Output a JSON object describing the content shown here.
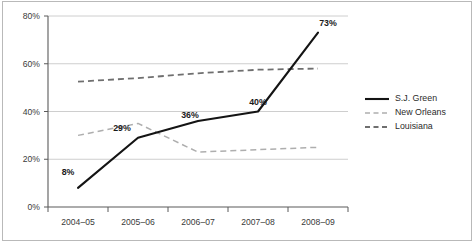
{
  "chart_data": {
    "type": "line",
    "title": "",
    "subtitle": "",
    "xlabel": "",
    "ylabel": "",
    "categories": [
      "2004–05",
      "2005–06",
      "2006–07",
      "2007–08",
      "2008–09"
    ],
    "ylim": [
      0,
      80
    ],
    "ytick_labels": [
      "0%",
      "20%",
      "40%",
      "60%",
      "80%"
    ],
    "ytick_values": [
      0,
      20,
      40,
      60,
      80
    ],
    "grid": "horizontal",
    "legend_position": "right",
    "series": [
      {
        "name": "S.J. Green",
        "style": "solid",
        "color": "#141414",
        "values": [
          8,
          29,
          36,
          40,
          73
        ],
        "point_labels": [
          "8%",
          "29%",
          "36%",
          "40%",
          "73%"
        ]
      },
      {
        "name": "New Orleans",
        "style": "dashed",
        "color": "#aeaeae",
        "values": [
          30,
          35,
          23,
          24,
          25
        ],
        "point_labels": [
          "",
          "",
          "",
          "",
          ""
        ]
      },
      {
        "name": "Louisiana",
        "style": "dashed",
        "color": "#6f6f6f",
        "values": [
          52.5,
          54,
          56,
          57.5,
          58
        ],
        "point_labels": [
          "",
          "",
          "",
          "",
          ""
        ]
      }
    ]
  },
  "axes": {
    "y_ticks": [
      {
        "label": "80%"
      },
      {
        "label": "60%"
      },
      {
        "label": "40%"
      },
      {
        "label": "20%"
      },
      {
        "label": "0%"
      }
    ],
    "x_ticks": [
      {
        "label": "2004–05"
      },
      {
        "label": "2005–06"
      },
      {
        "label": "2006–07"
      },
      {
        "label": "2007–08"
      },
      {
        "label": "2008–09"
      }
    ]
  },
  "data_labels": [
    {
      "text": "8%"
    },
    {
      "text": "29%"
    },
    {
      "text": "36%"
    },
    {
      "text": "40%"
    },
    {
      "text": "73%"
    }
  ],
  "legend": {
    "items": [
      {
        "label": "S.J. Green"
      },
      {
        "label": "New Orleans"
      },
      {
        "label": "Louisiana"
      }
    ]
  }
}
